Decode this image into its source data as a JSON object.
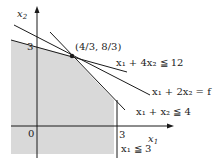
{
  "diagram": {
    "type": "linear-programming-feasible-region",
    "axes": {
      "x_label": "x",
      "x_label_sub": "1",
      "y_label": "x",
      "y_label_sub": "2",
      "origin_label": "0",
      "x_tick_label": "3",
      "y_tick_label": "3"
    },
    "vertex_label": "(4/3, 8/3)",
    "constraints": [
      {
        "id": "c1",
        "label": "x₁ + 4x₂ ≦ 12"
      },
      {
        "id": "objective",
        "label": "x₁ + 2x₂ = f"
      },
      {
        "id": "c2",
        "label": "x₁ + x₂ ≦ 4"
      },
      {
        "id": "c3",
        "label": "x₁ ≦ 3"
      }
    ],
    "colors": {
      "region_fill": "#d9d9d9",
      "line": "#1a1a1a",
      "background": "#ffffff"
    }
  }
}
